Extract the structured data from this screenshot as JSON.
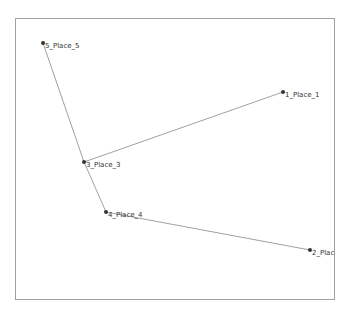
{
  "diagram": {
    "type": "network-graph",
    "frame": {
      "left": 15,
      "top": 18,
      "right": 335,
      "bottom": 300,
      "border_color": "#a0a0a0"
    },
    "node_color": "#333333",
    "edge_color": "#888888",
    "nodes": [
      {
        "id": "5",
        "label": "5_Place_5",
        "x": 43,
        "y": 43
      },
      {
        "id": "1",
        "label": "1_Place_1",
        "x": 283,
        "y": 92
      },
      {
        "id": "3",
        "label": "3_Place_3",
        "x": 84,
        "y": 162
      },
      {
        "id": "4",
        "label": "4_Place_4",
        "x": 106,
        "y": 212
      },
      {
        "id": "2",
        "label": "2_Place_",
        "x": 310,
        "y": 250
      }
    ],
    "edges": [
      {
        "from": "5",
        "to": "3"
      },
      {
        "from": "3",
        "to": "1"
      },
      {
        "from": "3",
        "to": "4"
      },
      {
        "from": "4",
        "to": "2"
      }
    ]
  }
}
